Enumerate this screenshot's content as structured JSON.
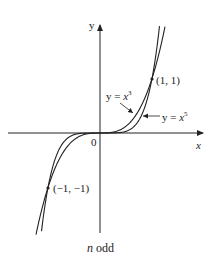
{
  "figure": {
    "axes": {
      "x_label": "x",
      "y_label": "y",
      "origin_label": "0"
    },
    "curves": [
      {
        "name": "cubic",
        "label_prefix": "y = ",
        "label_var": "x",
        "label_exp": "3",
        "exponent": 3
      },
      {
        "name": "quintic",
        "label_prefix": "y = ",
        "label_var": "x",
        "label_exp": "5",
        "exponent": 5
      }
    ],
    "points": [
      {
        "label": "(1, 1)",
        "x": 1,
        "y": 1
      },
      {
        "label": "(−1, −1)",
        "x": -1,
        "y": -1
      }
    ],
    "caption": {
      "var": "n",
      "text": " odd"
    },
    "colors": {
      "ink": "#222222",
      "background": "#ffffff"
    }
  }
}
